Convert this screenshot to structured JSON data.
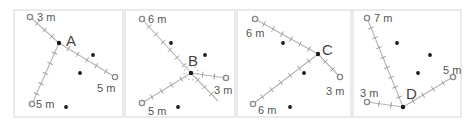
{
  "figure": {
    "panels": [
      {
        "id": "A",
        "label": "A",
        "center": [
          59,
          43
        ],
        "measurements": [
          {
            "to": [
              30,
              17
            ],
            "label": "3 m",
            "label_pos": [
              37,
              21
            ]
          },
          {
            "to": [
              115,
              77
            ],
            "label": "5 m",
            "label_pos": [
              97,
              92
            ]
          },
          {
            "to": [
              32,
              104
            ],
            "label": "5 m",
            "label_pos": [
              36,
              108
            ]
          }
        ],
        "dots": [
          [
            93,
            55
          ],
          [
            80,
            73
          ],
          [
            66,
            107
          ]
        ],
        "label_pos": [
          66,
          46
        ]
      },
      {
        "id": "B",
        "label": "B",
        "center": [
          191,
          73
        ],
        "measurements": [
          {
            "to": [
              142,
              19
            ],
            "label": "6 m",
            "label_pos": [
              148,
              23
            ]
          },
          {
            "to": [
              226,
              78
            ],
            "label": "3 m",
            "label_pos": [
              214,
              94
            ]
          },
          {
            "to": [
              142,
              103
            ],
            "label": "5 m",
            "label_pos": [
              148,
              115
            ]
          }
        ],
        "extra_tape": {
          "to": [
            218,
            101
          ]
        },
        "dots": [
          [
            171,
            43
          ],
          [
            205,
            55
          ],
          [
            178,
            107
          ]
        ],
        "label_pos": [
          188,
          66
        ]
      },
      {
        "id": "C",
        "label": "C",
        "center": [
          318,
          54
        ],
        "measurements": [
          {
            "to": [
              255,
              19
            ],
            "label": "6 m",
            "label_pos": [
              246,
              37
            ]
          },
          {
            "to": [
              340,
              77
            ],
            "label": "3 m",
            "label_pos": [
              326,
              95
            ]
          },
          {
            "to": [
              253,
              104
            ],
            "label": "6 m",
            "label_pos": [
              258,
              114
            ]
          }
        ],
        "dots": [
          [
            283,
            43
          ],
          [
            304,
            73
          ],
          [
            290,
            107
          ]
        ],
        "label_pos": [
          322,
          55
        ]
      },
      {
        "id": "D",
        "label": "D",
        "center": [
          403,
          107
        ],
        "measurements": [
          {
            "to": [
              367,
              18
            ],
            "label": "7 m",
            "label_pos": [
              374,
              22
            ]
          },
          {
            "to": [
              453,
              77
            ],
            "label": "5 m",
            "label_pos": [
              443,
              74
            ]
          },
          {
            "to": [
              367,
              102
            ],
            "label": "3 m",
            "label_pos": [
              360,
              97
            ]
          }
        ],
        "dots": [
          [
            397,
            43
          ],
          [
            430,
            55
          ],
          [
            418,
            73
          ]
        ],
        "label_pos": [
          406,
          99
        ]
      }
    ],
    "panel_boxes": [
      [
        14,
        10,
        109,
        107
      ],
      [
        125,
        10,
        110,
        107
      ],
      [
        237,
        10,
        114,
        107
      ],
      [
        353,
        10,
        108,
        107
      ]
    ],
    "colors": {
      "tape": "#b4b4b4",
      "ring": "#8a8a8a",
      "dot": "#1a1a1a",
      "border": "#dcdcdc",
      "text": "#555555"
    }
  }
}
